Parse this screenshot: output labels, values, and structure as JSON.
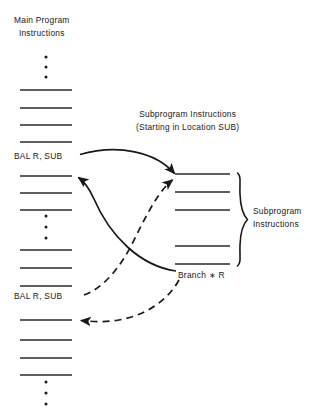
{
  "figure": {
    "type": "control-flow-diagram",
    "background_color": "#ffffff",
    "ink_color": "#19191b"
  },
  "captions": {
    "main_program": "Main Program\nInstructions",
    "main_program_line1": "Main Program",
    "main_program_line2": "Instructions",
    "subprogram_header_line1": "Subprogram Instructions",
    "subprogram_header_line2": "(Starting in Location SUB)",
    "bracket_label_line1": "Subprogram",
    "bracket_label_line2": "Instructions"
  },
  "instructions": {
    "bal_top": "BAL R,  SUB",
    "bal_bottom": "BAL R,  SUB",
    "branch": "Branch  ∗ R"
  },
  "main_column": {
    "x_start": 20,
    "x_end": 72,
    "ellipsis_groups": [
      {
        "name": "top-ellipsis",
        "dots": 3,
        "x": 46,
        "y_values": [
          57,
          67,
          77
        ]
      },
      {
        "name": "middle-ellipsis",
        "dots": 3,
        "x": 46,
        "y_values": [
          216,
          227,
          238
        ]
      },
      {
        "name": "bottom-ellipsis",
        "dots": 3,
        "x": 46,
        "y_values": [
          382,
          393,
          404
        ]
      }
    ],
    "rule_y_values": [
      90,
      108,
      125,
      142,
      176,
      193,
      210,
      250,
      268,
      286,
      320,
      340,
      358,
      375
    ]
  },
  "sub_column": {
    "x_start": 175,
    "x_end": 230,
    "rule_y_values": [
      174,
      192,
      210,
      246,
      264
    ]
  },
  "bracket": {
    "x": 238,
    "y_top": 174,
    "y_bottom": 266,
    "tip_x": 248
  },
  "arrows": [
    {
      "name": "call-arrow-top",
      "style": "solid",
      "from": "bal-top-label",
      "to": "subprogram-first-instruction",
      "from_point": [
        80,
        155
      ],
      "to_point": [
        176,
        176
      ]
    },
    {
      "name": "return-arrow-top",
      "style": "solid",
      "from": "branch-instruction",
      "to": "main-instruction-after-bal-top",
      "from_point": [
        176,
        272
      ],
      "to_point": [
        74,
        178
      ]
    },
    {
      "name": "call-arrow-bottom",
      "style": "dashed",
      "from": "bal-bottom-label",
      "to": "subprogram-first-instruction",
      "from_point": [
        82,
        296
      ],
      "to_point": [
        176,
        180
      ]
    },
    {
      "name": "return-arrow-bottom",
      "style": "dashed",
      "from": "branch-instruction",
      "to": "main-instruction-after-bal-bottom",
      "from_point": [
        178,
        280
      ],
      "to_point": [
        74,
        320
      ]
    }
  ]
}
